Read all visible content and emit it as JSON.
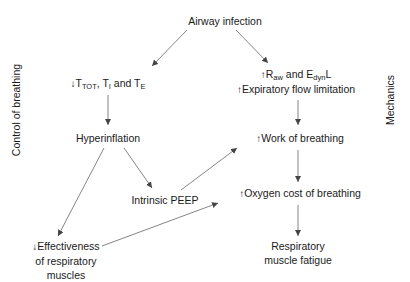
{
  "diagram": {
    "title_node": "Airway infection",
    "side_labels": {
      "left": "Control of breathing",
      "right": "Mechanics"
    },
    "nodes": {
      "timing": {
        "arrow": "↓",
        "parts": [
          {
            "text": "T",
            "sub": "TOT"
          },
          {
            "text": ", T",
            "sub": "I"
          },
          {
            "text": " and T",
            "sub": "E"
          }
        ]
      },
      "resistance": {
        "arrow": "↑",
        "line1_parts": [
          {
            "text": "R",
            "sub": "aw"
          },
          {
            "text": " and E",
            "sub": "dyn"
          },
          {
            "text": "L",
            "sub": ""
          }
        ],
        "line2_arrow": "↑",
        "line2": "Expiratory flow limitation"
      },
      "hyperinflation": "Hyperinflation",
      "work": {
        "arrow": "↑",
        "label": "Work of breathing"
      },
      "peep": "Intrinsic PEEP",
      "oxygen": {
        "arrow": "↑",
        "label": "Oxygen cost of breathing"
      },
      "effectiveness": {
        "arrow": "↓",
        "lines": [
          "Effectiveness",
          "of respiratory",
          "muscles"
        ]
      },
      "fatigue": {
        "lines": [
          "Respiratory",
          "muscle fatigue"
        ]
      }
    },
    "edges": [
      {
        "from": "Airway infection",
        "to": "↓TTOT, TI and TE"
      },
      {
        "from": "Airway infection",
        "to": "↑Raw and EdynL"
      },
      {
        "from": "↓TTOT, TI and TE",
        "to": "Hyperinflation"
      },
      {
        "from": "↑Expiratory flow limitation",
        "to": "↑Work of breathing"
      },
      {
        "from": "Hyperinflation",
        "to": "Intrinsic PEEP"
      },
      {
        "from": "Hyperinflation",
        "to": "↓Effectiveness of respiratory muscles"
      },
      {
        "from": "Intrinsic PEEP",
        "to": "↑Work of breathing"
      },
      {
        "from": "↑Work of breathing",
        "to": "↑Oxygen cost of breathing"
      },
      {
        "from": "↓Effectiveness of respiratory muscles",
        "to": "↑Oxygen cost of breathing"
      },
      {
        "from": "↑Oxygen cost of breathing",
        "to": "Respiratory muscle fatigue"
      }
    ],
    "colors": {
      "text": "#1a1a1a",
      "arrow": "#555555",
      "background": "#ffffff"
    }
  }
}
